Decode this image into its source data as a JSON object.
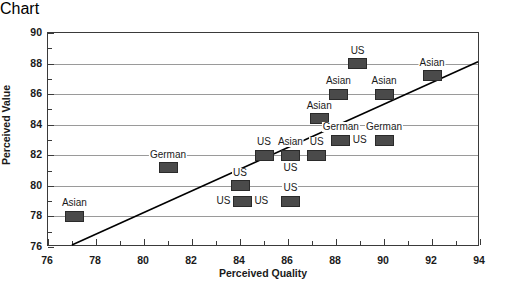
{
  "chart_data": {
    "type": "scatter",
    "title": "",
    "xlabel": "Perceived Quality",
    "ylabel": "Perceived Value",
    "xlim": [
      76,
      94
    ],
    "ylim": [
      76,
      90
    ],
    "xticks": [
      76,
      78,
      80,
      82,
      84,
      86,
      88,
      90,
      92,
      94
    ],
    "yticks": [
      76,
      78,
      80,
      82,
      84,
      86,
      88,
      90
    ],
    "xtick_labels": [
      "76",
      "78",
      "80",
      "82",
      "84",
      "86",
      "88",
      "90",
      "92",
      "94"
    ],
    "ytick_labels": [
      "76",
      "78",
      "80",
      "82",
      "84",
      "86",
      "88",
      "90"
    ],
    "xtick_minor_step": 1,
    "ytick_minor_step": 1,
    "grid": "horizontal",
    "grid_color": "#9a9a9a",
    "marker_color": "#4a4a4a",
    "marker_edge_color": "#2a2a2a",
    "axis_color": "#3a3a3a",
    "legend_position": "none",
    "point_label_field": "label",
    "points": [
      {
        "label": "Asian",
        "x": 77.1,
        "y": 78.0,
        "label_pos": "above"
      },
      {
        "label": "German",
        "x": 81.0,
        "y": 81.2,
        "label_pos": "above"
      },
      {
        "label": "US",
        "x": 84.0,
        "y": 80.0,
        "label_pos": "above"
      },
      {
        "label": "US",
        "x": 84.1,
        "y": 79.0,
        "label_pos": "left"
      },
      {
        "label": "US",
        "x": 84.1,
        "y": 79.0,
        "label_pos": "right"
      },
      {
        "label": "US",
        "x": 86.1,
        "y": 79.0,
        "label_pos": "above"
      },
      {
        "label": "US",
        "x": 85.0,
        "y": 82.0,
        "label_pos": "above"
      },
      {
        "label": "Asian",
        "x": 86.1,
        "y": 82.0,
        "label_pos": "above"
      },
      {
        "label": "US",
        "x": 86.1,
        "y": 82.0,
        "label_pos": "below"
      },
      {
        "label": "US",
        "x": 87.2,
        "y": 82.0,
        "label_pos": "above"
      },
      {
        "label": "Asian",
        "x": 87.3,
        "y": 84.4,
        "label_pos": "above"
      },
      {
        "label": "German",
        "x": 88.2,
        "y": 83.0,
        "label_pos": "above"
      },
      {
        "label": "US",
        "x": 88.2,
        "y": 83.0,
        "label_pos": "right"
      },
      {
        "label": "German",
        "x": 90.0,
        "y": 83.0,
        "label_pos": "above"
      },
      {
        "label": "Asian",
        "x": 88.1,
        "y": 86.0,
        "label_pos": "above"
      },
      {
        "label": "Asian",
        "x": 90.0,
        "y": 86.0,
        "label_pos": "above"
      },
      {
        "label": "US",
        "x": 88.9,
        "y": 88.0,
        "label_pos": "above"
      },
      {
        "label": "Asian",
        "x": 92.0,
        "y": 87.2,
        "label_pos": "above"
      }
    ],
    "trendline": {
      "type": "line",
      "x": [
        77.0,
        94.0
      ],
      "y": [
        76.0,
        88.1
      ],
      "color": "#000000",
      "width": 1.6
    }
  }
}
